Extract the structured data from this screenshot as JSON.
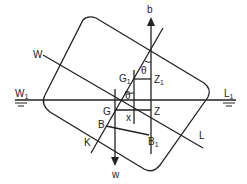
{
  "diagram": {
    "type": "ship-stability-heel",
    "colors": {
      "line": "#222222",
      "background": "#ffffff"
    },
    "labels": {
      "b": "b",
      "w": "w",
      "W": "W",
      "L": "L",
      "W1": "W",
      "W1_sub": "1",
      "L1": "L",
      "L1_sub": "1",
      "G": "G",
      "G1": "G",
      "G1_sub": "1",
      "Z": "Z",
      "Z1": "Z",
      "Z1_sub": "1",
      "B": "B",
      "B1": "B",
      "B1_sub": "1",
      "K": "K",
      "x": "x",
      "theta_top": "θ",
      "theta_mid": "θ"
    },
    "elements": [
      "hull-outline",
      "waterline-W1L1",
      "inclined-waterline-WL",
      "centreline-K",
      "buoyancy-arrow-b",
      "weight-arrow-w",
      "GZ-lever",
      "G1Z1-lever",
      "BB1-shift"
    ]
  }
}
